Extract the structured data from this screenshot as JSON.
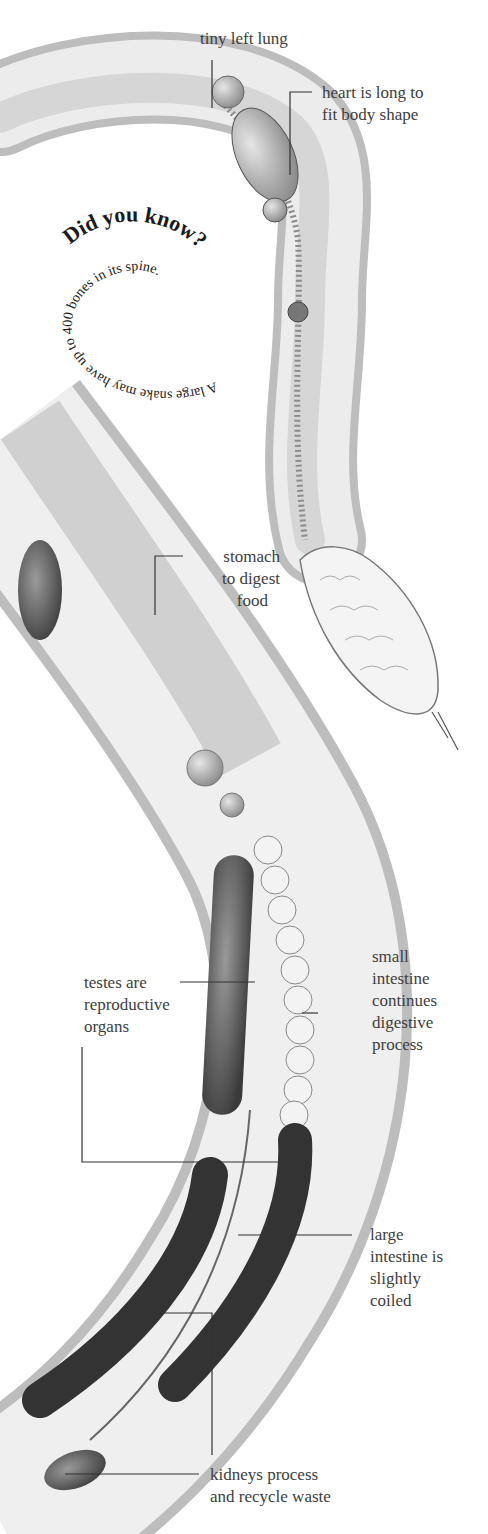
{
  "diagram": {
    "labels": [
      {
        "id": "lung",
        "text": "tiny left lung"
      },
      {
        "id": "heart",
        "text": "heart is long to fit body shape",
        "lines": [
          "heart is long to",
          "fit body shape"
        ]
      },
      {
        "id": "stomach",
        "lines": [
          "stomach",
          "to digest",
          "food"
        ]
      },
      {
        "id": "testes",
        "lines": [
          "testes are",
          "reproductive",
          "organs"
        ]
      },
      {
        "id": "small_intestine",
        "lines": [
          "small",
          "intestine",
          "continues",
          "digestive",
          "process"
        ]
      },
      {
        "id": "large_intestine",
        "lines": [
          "large",
          "intestine is",
          "slightly",
          "coiled"
        ]
      },
      {
        "id": "kidneys",
        "lines": [
          "kidneys process",
          "and recycle waste"
        ]
      }
    ],
    "did_you_know": {
      "heading": "Did you know?",
      "body": "A large snake may have up to 400 bones in its spine."
    }
  }
}
